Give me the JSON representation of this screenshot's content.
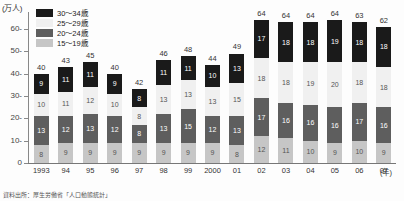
{
  "axis_unit_label": "(万人)",
  "x_axis_name": "(年)",
  "footnote": "資料出所：厚生労働省「人口動態統計」",
  "legend": {
    "items": [
      {
        "label": "30～34歳",
        "key": "30-34",
        "color": "#1a1a1a",
        "swatch_name": "legend-swatch-30-34"
      },
      {
        "label": "25～29歳",
        "key": "25-29",
        "color": "#f0f0f0",
        "swatch_name": "legend-swatch-25-29"
      },
      {
        "label": "20～24歳",
        "key": "20-24",
        "color": "#5e5e5e",
        "swatch_name": "legend-swatch-20-24"
      },
      {
        "label": "15～19歳",
        "key": "15-19",
        "color": "#c6c6c6",
        "swatch_name": "legend-swatch-15-19"
      }
    ]
  },
  "chart_data": {
    "type": "bar",
    "subtype": "stacked-column",
    "title": "",
    "xlabel": "(年)",
    "ylabel": "(万人)",
    "ylim": [
      0,
      68
    ],
    "yticks": [
      0,
      10,
      20,
      30,
      40,
      50,
      60
    ],
    "ytick_labels": [
      "0",
      "10-",
      "20-",
      "30-",
      "40-",
      "50-",
      "60-"
    ],
    "grid": false,
    "legend_position": "top-left",
    "categories": [
      "1993",
      "94",
      "95",
      "96",
      "97",
      "98",
      "99",
      "2000",
      "01",
      "02",
      "03",
      "04",
      "05",
      "06",
      "07"
    ],
    "series": [
      {
        "name": "30～34歳",
        "color": "#1a1a1a",
        "values": [
          9,
          11,
          11,
          9,
          8,
          11,
          11,
          10,
          13,
          17,
          18,
          18,
          19,
          18,
          18
        ]
      },
      {
        "name": "25～29歳",
        "color": "#f0f0f0",
        "values": [
          10,
          11,
          12,
          10,
          8,
          13,
          13,
          13,
          15,
          18,
          18,
          19,
          20,
          18,
          18
        ]
      },
      {
        "name": "20～24歳",
        "color": "#5e5e5e",
        "values": [
          13,
          12,
          13,
          12,
          8,
          13,
          15,
          12,
          13,
          17,
          16,
          16,
          16,
          17,
          16
        ]
      },
      {
        "name": "15～19歳",
        "color": "#c6c6c6",
        "values": [
          8,
          9,
          9,
          9,
          9,
          9,
          9,
          9,
          8,
          12,
          11,
          10,
          9,
          10,
          9
        ]
      }
    ],
    "totals": [
      40,
      43,
      45,
      40,
      42,
      46,
      48,
      44,
      49,
      64,
      64,
      64,
      64,
      63,
      62
    ]
  }
}
